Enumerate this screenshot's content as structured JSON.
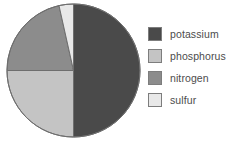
{
  "chart_data": {
    "type": "pie",
    "title": "",
    "subtitle": "",
    "xlabel": "",
    "ylabel": "",
    "legend_position": "right",
    "grid": false,
    "categories": [
      "potassium",
      "phosphorus",
      "nitrogen",
      "sulfur"
    ],
    "values": [
      50.0,
      25.0,
      21.5,
      3.5
    ],
    "units": "percent",
    "slices": [
      {
        "label": "potassium",
        "value": 50.0,
        "color": "#4a4a4a",
        "start_angle": 0,
        "end_angle": 180
      },
      {
        "label": "phosphorus",
        "value": 25.0,
        "color": "#c4c4c4",
        "start_angle": 180,
        "end_angle": 270
      },
      {
        "label": "nitrogen",
        "value": 21.5,
        "color": "#8c8c8c",
        "start_angle": 270,
        "end_angle": 347.4
      },
      {
        "label": "sulfur",
        "value": 3.5,
        "color": "#e8e8e8",
        "start_angle": 347.4,
        "end_angle": 360
      }
    ]
  },
  "figure": {
    "background_color": "#ffffff",
    "pie": {
      "center_x": 73.5,
      "center_y": 70.5,
      "radius": 66.5,
      "outline_color": "#6e6e6e"
    },
    "legend": {
      "items": [
        {
          "label": "potassium",
          "color": "#4a4a4a"
        },
        {
          "label": "phosphorus",
          "color": "#c4c4c4"
        },
        {
          "label": "nitrogen",
          "color": "#8c8c8c"
        },
        {
          "label": "sulfur",
          "color": "#e8e8e8"
        }
      ]
    }
  }
}
